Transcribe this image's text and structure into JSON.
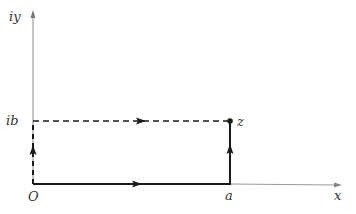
{
  "diagram": {
    "type": "complex-plane-contour",
    "axes": {
      "x_label": "x",
      "y_label": "iy",
      "color": "#888888"
    },
    "points": {
      "origin_label": "O",
      "a_label": "a",
      "ib_label": "ib",
      "z_label": "z"
    },
    "paths": [
      {
        "name": "path-O-to-a",
        "style": "solid",
        "from": "O",
        "to": "a",
        "direction": "right"
      },
      {
        "name": "path-a-to-z",
        "style": "solid",
        "from": "a",
        "to": "z",
        "direction": "up"
      },
      {
        "name": "path-O-to-ib",
        "style": "dashed",
        "from": "O",
        "to": "ib",
        "direction": "up"
      },
      {
        "name": "path-ib-to-z",
        "style": "dashed",
        "from": "ib",
        "to": "z",
        "direction": "right"
      }
    ],
    "colors": {
      "path": "#1a1a1a",
      "axis": "#888888",
      "label": "#333333"
    }
  }
}
